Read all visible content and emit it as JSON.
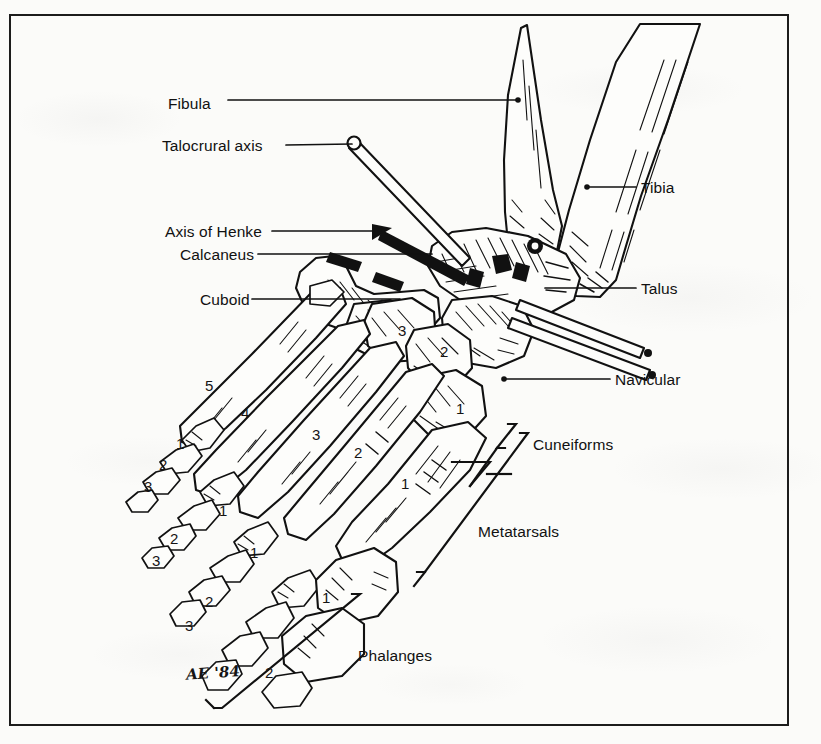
{
  "figure": {
    "signature": "AE '84",
    "ink_color": "#111111",
    "paper_color": "#fbfbf9",
    "border_color": "#1c1c1c"
  },
  "labels_left": [
    {
      "id": "fibula",
      "text": "Fibula",
      "x": 168,
      "y": 95,
      "leader_to_x": 517,
      "leader_to_y": 100
    },
    {
      "id": "talocrural-axis",
      "text": "Talocrural axis",
      "x": 162,
      "y": 142,
      "leader_to_x": 352,
      "leader_to_y": 145
    },
    {
      "id": "axis-of-henke",
      "text": "Axis of Henke",
      "x": 165,
      "y": 226,
      "leader_to_x": 380,
      "leader_to_y": 231
    },
    {
      "id": "calcaneus",
      "text": "Calcaneus",
      "x": 180,
      "y": 254,
      "leader_to_x": 430,
      "leader_to_y": 254
    },
    {
      "id": "cuboid",
      "text": "Cuboid",
      "x": 200,
      "y": 296,
      "leader_to_x": 398,
      "leader_to_y": 299
    }
  ],
  "labels_right": [
    {
      "id": "tibia",
      "text": "Tibia",
      "x": 641,
      "y": 181,
      "leader_to_x": 588,
      "leader_to_y": 187
    },
    {
      "id": "talus",
      "text": "Talus",
      "x": 641,
      "y": 283,
      "leader_to_x": 545,
      "leader_to_y": 288
    },
    {
      "id": "navicular",
      "text": "Navicular",
      "x": 615,
      "y": 382,
      "leader_to_x": 520,
      "leader_to_y": 379
    }
  ],
  "group_labels": [
    {
      "id": "cuneiforms",
      "text": "Cuneiforms",
      "x": 513,
      "y": 444
    },
    {
      "id": "metatarsals",
      "text": "Metatarsals",
      "x": 478,
      "y": 531
    },
    {
      "id": "phalanges",
      "text": "Phalanges",
      "x": 358,
      "y": 655
    }
  ],
  "cuneiform_numbers": [
    {
      "n": "3",
      "x": 398,
      "y": 330
    },
    {
      "n": "2",
      "x": 440,
      "y": 351
    },
    {
      "n": "1",
      "x": 456,
      "y": 408
    }
  ],
  "metatarsal_numbers": [
    {
      "n": "5",
      "x": 205,
      "y": 385
    },
    {
      "n": "4",
      "x": 241,
      "y": 412
    },
    {
      "n": "3",
      "x": 312,
      "y": 434
    },
    {
      "n": "2",
      "x": 354,
      "y": 452
    },
    {
      "n": "1",
      "x": 401,
      "y": 483
    }
  ],
  "phalanx_numbers": [
    {
      "n": "1",
      "x": 176,
      "y": 443
    },
    {
      "n": "2",
      "x": 159,
      "y": 464
    },
    {
      "n": "3",
      "x": 144,
      "y": 486
    },
    {
      "n": "1",
      "x": 219,
      "y": 510
    },
    {
      "n": "2",
      "x": 170,
      "y": 538
    },
    {
      "n": "3",
      "x": 152,
      "y": 560
    },
    {
      "n": "1",
      "x": 250,
      "y": 552
    },
    {
      "n": "2",
      "x": 205,
      "y": 601
    },
    {
      "n": "3",
      "x": 185,
      "y": 625
    },
    {
      "n": "1",
      "x": 322,
      "y": 597
    },
    {
      "n": "2",
      "x": 265,
      "y": 672
    }
  ]
}
